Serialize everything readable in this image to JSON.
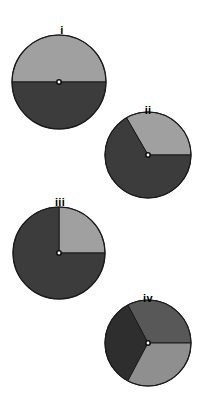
{
  "figure": {
    "title": "",
    "background_color": "#ffffff",
    "width": 209,
    "height": 415,
    "outline_color": "#1a1a1a",
    "hub_outer_color": "#111111",
    "hub_inner_color": "#ffffff"
  },
  "labels": {
    "i": "i",
    "ii": "ii",
    "iii": "iii",
    "iv": "iv"
  },
  "palette": {
    "light_gray": "#a0a0a0",
    "medium_gray": "#8f8f8f",
    "mid_dark_gray": "#585858",
    "dark_gray": "#3c3c3c",
    "darkest_gray": "#2e2e2e"
  },
  "chart_data": {
    "type": "pie",
    "title": "",
    "subtitle": "",
    "xlabel": "",
    "ylabel": "",
    "legend_position": "none",
    "grid": false,
    "panel_count": 4,
    "panels": [
      {
        "label": "i",
        "label_x": 62,
        "label_y": 25,
        "center_x": 59,
        "center_y": 82,
        "radius": 47,
        "slice_count": 2,
        "categories": [
          "upper half",
          "lower half"
        ],
        "values": [
          50,
          50
        ],
        "slices": [
          {
            "name": "upper half",
            "value": 50,
            "start_deg": 0,
            "end_deg": 180,
            "color": "#a0a0a0"
          },
          {
            "name": "lower half",
            "value": 50,
            "start_deg": 180,
            "end_deg": 360,
            "color": "#3c3c3c"
          }
        ]
      },
      {
        "label": "ii",
        "label_x": 148,
        "label_y": 105,
        "center_x": 148,
        "center_y": 155,
        "radius": 43,
        "slice_count": 2,
        "categories": [
          "light wedge",
          "dark wedge"
        ],
        "values": [
          33,
          67
        ],
        "slices": [
          {
            "name": "light wedge",
            "value": 33,
            "start_deg": 0,
            "end_deg": 120,
            "color": "#a0a0a0"
          },
          {
            "name": "dark wedge",
            "value": 67,
            "start_deg": 120,
            "end_deg": 360,
            "color": "#3c3c3c"
          }
        ]
      },
      {
        "label": "iii",
        "label_x": 60,
        "label_y": 197,
        "center_x": 59,
        "center_y": 253,
        "radius": 46,
        "slice_count": 2,
        "categories": [
          "light quadrant",
          "dark remainder"
        ],
        "values": [
          25,
          75
        ],
        "slices": [
          {
            "name": "light quadrant",
            "value": 25,
            "start_deg": 0,
            "end_deg": 90,
            "color": "#a0a0a0"
          },
          {
            "name": "dark remainder",
            "value": 75,
            "start_deg": 90,
            "end_deg": 360,
            "color": "#3c3c3c"
          }
        ]
      },
      {
        "label": "iv",
        "label_x": 148,
        "label_y": 293,
        "center_x": 148,
        "center_y": 343,
        "radius": 43,
        "slice_count": 3,
        "categories": [
          "upper-right third",
          "left third",
          "lower-right third"
        ],
        "values": [
          33,
          33,
          34
        ],
        "slices": [
          {
            "name": "upper-right third",
            "value": 33,
            "start_deg": 0,
            "end_deg": 118,
            "color": "#585858"
          },
          {
            "name": "left third",
            "value": 33,
            "start_deg": 118,
            "end_deg": 242,
            "color": "#2e2e2e"
          },
          {
            "name": "lower-right third",
            "value": 34,
            "start_deg": 242,
            "end_deg": 360,
            "color": "#8f8f8f"
          }
        ]
      }
    ]
  }
}
